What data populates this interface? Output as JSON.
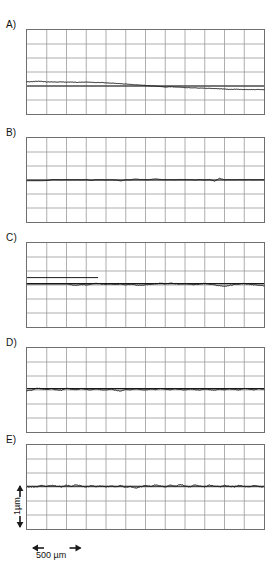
{
  "figure": {
    "title": "",
    "panel_labels": [
      "A)",
      "B)",
      "C)",
      "D)",
      "E)"
    ],
    "scale_bars": {
      "vertical_label": "1µm",
      "horizontal_label": "500 µm"
    }
  },
  "chart_data": {
    "type": "line",
    "title": "",
    "xlabel": "",
    "ylabel": "",
    "grid": true,
    "legend_position": "none",
    "axis_note": "Each panel shows a surface-profile trace on a 12 x 6 grid; horizontal grid cell = 250 um, vertical grid cell = 0.5 um",
    "grid_columns": 12,
    "grid_rows": 6,
    "x_cell_um": 250,
    "y_cell_um": 0.5,
    "scale_bar_x_um": 500,
    "scale_bar_y_um": 1,
    "panels": [
      {
        "label": "A)",
        "description": "Downward sloping trace with fine roughness; baseline reference line near lower third",
        "baseline_row": 4.0,
        "x": [
          0,
          0.25,
          0.5,
          0.75,
          1,
          1.25,
          1.5,
          1.75,
          2,
          2.25,
          2.5,
          2.75,
          3,
          3.25,
          3.5,
          3.75,
          4,
          4.25,
          4.5,
          4.75,
          5,
          5.25,
          5.5,
          5.75,
          6,
          6.25,
          6.5,
          6.75,
          7,
          7.25,
          7.5,
          7.75,
          8,
          8.25,
          8.5,
          8.75,
          9,
          9.25,
          9.5,
          9.75,
          10,
          10.25,
          10.5,
          10.75,
          11,
          11.25,
          11.5,
          11.75,
          12
        ],
        "y": [
          3.7,
          3.69,
          3.66,
          3.67,
          3.71,
          3.7,
          3.72,
          3.71,
          3.73,
          3.72,
          3.74,
          3.73,
          3.72,
          3.74,
          3.76,
          3.75,
          3.77,
          3.79,
          3.81,
          3.84,
          3.86,
          3.89,
          3.91,
          3.94,
          3.96,
          3.99,
          4.01,
          4.04,
          4.08,
          4.05,
          4.07,
          4.09,
          4.11,
          4.12,
          4.13,
          4.15,
          4.16,
          4.17,
          4.18,
          4.2,
          4.22,
          4.25,
          4.23,
          4.24,
          4.26,
          4.25,
          4.26,
          4.25,
          4.26
        ]
      },
      {
        "label": "B)",
        "description": "Flat baseline with small discrete spikes, slightly raised after first fifth",
        "baseline_row": 3.0,
        "x": [
          0,
          0.25,
          0.5,
          0.75,
          1,
          1.25,
          1.5,
          1.75,
          2,
          2.25,
          2.5,
          2.75,
          3,
          3.25,
          3.5,
          3.75,
          4,
          4.25,
          4.5,
          4.75,
          5,
          5.25,
          5.5,
          5.75,
          6,
          6.25,
          6.5,
          6.75,
          7,
          7.25,
          7.5,
          7.75,
          8,
          8.25,
          8.5,
          8.75,
          9,
          9.25,
          9.5,
          9.75,
          10,
          10.25,
          10.5,
          10.75,
          11,
          11.25,
          11.5,
          11.75,
          12
        ],
        "y": [
          3.05,
          3.05,
          3.05,
          3.05,
          3.04,
          2.98,
          2.97,
          2.98,
          2.97,
          2.98,
          2.97,
          2.99,
          2.97,
          3.03,
          2.98,
          2.98,
          2.99,
          2.98,
          3.0,
          3.06,
          2.99,
          2.98,
          2.93,
          2.97,
          2.98,
          2.97,
          2.92,
          2.96,
          2.98,
          2.97,
          2.98,
          2.96,
          2.98,
          2.97,
          3.0,
          2.97,
          2.99,
          2.97,
          3.08,
          2.88,
          2.99,
          2.97,
          2.98,
          2.97,
          2.98,
          2.97,
          2.98,
          2.97,
          2.98
        ]
      },
      {
        "label": "C)",
        "description": "Flat baseline for first third then noisy fluctuating trace; two horizontal reference lines at left",
        "baseline_row": 2.9,
        "x": [
          0,
          0.25,
          0.5,
          0.75,
          1,
          1.25,
          1.5,
          1.75,
          2,
          2.25,
          2.5,
          2.75,
          3,
          3.25,
          3.5,
          3.75,
          4,
          4.25,
          4.5,
          4.75,
          5,
          5.25,
          5.5,
          5.75,
          6,
          6.25,
          6.5,
          6.75,
          7,
          7.25,
          7.5,
          7.75,
          8,
          8.25,
          8.5,
          8.75,
          9,
          9.25,
          9.5,
          9.75,
          10,
          10.25,
          10.5,
          10.75,
          11,
          11.25,
          11.5,
          11.75,
          12
        ],
        "y": [
          2.92,
          2.92,
          2.92,
          2.92,
          2.92,
          2.92,
          2.92,
          2.92,
          2.92,
          2.99,
          3.02,
          2.96,
          2.99,
          2.94,
          2.88,
          2.93,
          2.96,
          2.92,
          2.97,
          2.93,
          2.98,
          2.95,
          3.0,
          3.02,
          2.98,
          2.95,
          2.91,
          2.88,
          2.92,
          2.87,
          2.9,
          2.94,
          2.91,
          2.95,
          2.98,
          2.93,
          2.89,
          2.95,
          2.99,
          3.06,
          3.1,
          3.03,
          2.97,
          2.92,
          2.9,
          2.95,
          2.99,
          3.02,
          3.05
        ]
      },
      {
        "label": "D)",
        "description": "Regular quasi-periodic oscillating trace across full width",
        "baseline_row": 2.9,
        "x": [
          0,
          0.25,
          0.5,
          0.75,
          1,
          1.25,
          1.5,
          1.75,
          2,
          2.25,
          2.5,
          2.75,
          3,
          3.25,
          3.5,
          3.75,
          4,
          4.25,
          4.5,
          4.75,
          5,
          5.25,
          5.5,
          5.75,
          6,
          6.25,
          6.5,
          6.75,
          7,
          7.25,
          7.5,
          7.75,
          8,
          8.25,
          8.5,
          8.75,
          9,
          9.25,
          9.5,
          9.75,
          10,
          10.25,
          10.5,
          10.75,
          11,
          11.25,
          11.5,
          11.75,
          12
        ],
        "y": [
          3.05,
          3.02,
          2.86,
          2.92,
          2.97,
          2.9,
          3.0,
          3.02,
          2.88,
          2.95,
          2.98,
          2.9,
          2.97,
          2.99,
          2.92,
          2.98,
          3.0,
          2.94,
          3.02,
          3.08,
          2.96,
          2.99,
          2.92,
          2.97,
          3.0,
          2.93,
          2.98,
          2.88,
          2.95,
          2.99,
          2.91,
          2.96,
          3.0,
          2.92,
          2.97,
          3.01,
          2.93,
          2.98,
          3.02,
          2.94,
          2.99,
          2.91,
          2.96,
          3.0,
          2.88,
          2.94,
          2.98,
          2.9,
          2.95
        ]
      },
      {
        "label": "E)",
        "description": "High-frequency noisy trace about a flat baseline, with reference line underneath",
        "baseline_row": 2.95,
        "x": [
          0,
          0.25,
          0.5,
          0.75,
          1,
          1.25,
          1.5,
          1.75,
          2,
          2.25,
          2.5,
          2.75,
          3,
          3.25,
          3.5,
          3.75,
          4,
          4.25,
          4.5,
          4.75,
          5,
          5.25,
          5.5,
          5.75,
          6,
          6.25,
          6.5,
          6.75,
          7,
          7.25,
          7.5,
          7.75,
          8,
          8.25,
          8.5,
          8.75,
          9,
          9.25,
          9.5,
          9.75,
          10,
          10.25,
          10.5,
          10.75,
          11,
          11.25,
          11.5,
          11.75,
          12
        ],
        "y": [
          2.99,
          2.99,
          2.98,
          2.9,
          2.96,
          2.88,
          2.94,
          2.99,
          2.88,
          2.95,
          2.84,
          2.93,
          2.99,
          2.9,
          2.97,
          2.92,
          3.0,
          2.94,
          2.99,
          2.91,
          3.02,
          2.97,
          3.08,
          2.99,
          2.9,
          2.96,
          2.86,
          2.93,
          2.99,
          2.88,
          2.95,
          2.82,
          2.92,
          2.99,
          2.86,
          2.93,
          2.99,
          2.87,
          2.94,
          2.99,
          2.88,
          2.95,
          2.99,
          2.89,
          2.96,
          2.99,
          2.9,
          2.96,
          2.99
        ]
      }
    ]
  },
  "colors": {
    "trace": "#1a1a1a",
    "grid": "#9a9a9a",
    "grid_major": "#6f6f6f",
    "background": "#ffffff",
    "text": "#111111"
  }
}
